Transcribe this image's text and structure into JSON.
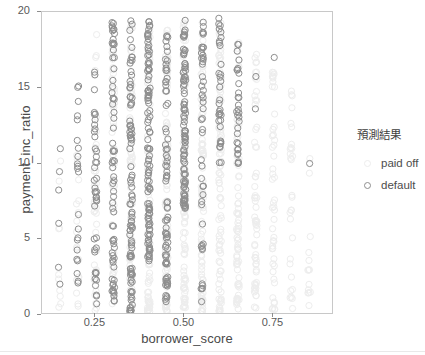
{
  "chart_data": {
    "type": "scatter",
    "title": "",
    "xlabel": "borrower_score",
    "ylabel": "payment_inc_ratio",
    "xlim": [
      0.1,
      0.92
    ],
    "ylim": [
      0,
      20
    ],
    "xticks": [
      0.25,
      0.5,
      0.75
    ],
    "xtick_labels": [
      "0.25",
      "0.50",
      "0.75"
    ],
    "yticks": [
      0,
      5,
      10,
      15,
      20
    ],
    "ytick_labels": [
      "0",
      "5",
      "10",
      "15",
      "20"
    ],
    "grid": false,
    "legend": {
      "title": "預測結果",
      "position": "right",
      "entries": [
        {
          "label": "paid off",
          "color": "#ededed",
          "marker": "open-circle"
        },
        {
          "label": "default",
          "color": "#8e8e8e",
          "marker": "open-circle"
        }
      ]
    },
    "marker": {
      "shape": "open-circle",
      "radius": 3.1,
      "stroke_width": 1
    },
    "x_columns": [
      0.15,
      0.2,
      0.25,
      0.3,
      0.35,
      0.4,
      0.45,
      0.5,
      0.55,
      0.6,
      0.65,
      0.7,
      0.75,
      0.8,
      0.85
    ],
    "series": [
      {
        "name": "default",
        "color": "#8e8e8e",
        "columns": [
          {
            "x": 0.15,
            "count": 6,
            "ymin": 1.8,
            "ymax": 11.3
          },
          {
            "x": 0.2,
            "count": 22,
            "ymin": 1.8,
            "ymax": 17.0
          },
          {
            "x": 0.25,
            "count": 42,
            "ymin": 0.4,
            "ymax": 16.3
          },
          {
            "x": 0.3,
            "count": 68,
            "ymin": 0.9,
            "ymax": 19.4
          },
          {
            "x": 0.35,
            "count": 96,
            "ymin": 0.2,
            "ymax": 19.6
          },
          {
            "x": 0.4,
            "count": 104,
            "ymin": 3.4,
            "ymax": 19.4
          },
          {
            "x": 0.45,
            "count": 78,
            "ymin": 0.7,
            "ymax": 18.6
          },
          {
            "x": 0.5,
            "count": 92,
            "ymin": 7.0,
            "ymax": 19.6
          },
          {
            "x": 0.55,
            "count": 48,
            "ymin": 0.8,
            "ymax": 19.4
          },
          {
            "x": 0.6,
            "count": 34,
            "ymin": 10.0,
            "ymax": 19.6
          },
          {
            "x": 0.65,
            "count": 30,
            "ymin": 10.0,
            "ymax": 18.2
          },
          {
            "x": 0.7,
            "count": 2,
            "ymin": 9.2,
            "ymax": 17.6
          },
          {
            "x": 0.75,
            "count": 1,
            "ymin": 17.0,
            "ymax": 17.0
          },
          {
            "x": 0.85,
            "count": 1,
            "ymin": 10.0,
            "ymax": 10.0
          }
        ]
      },
      {
        "name": "paid off",
        "color": "#ededed",
        "columns": [
          {
            "x": 0.15,
            "count": 10,
            "ymin": 0.5,
            "ymax": 13.0
          },
          {
            "x": 0.2,
            "count": 18,
            "ymin": 0.4,
            "ymax": 14.0
          },
          {
            "x": 0.25,
            "count": 40,
            "ymin": 0.3,
            "ymax": 19.0
          },
          {
            "x": 0.3,
            "count": 56,
            "ymin": 0.3,
            "ymax": 18.5
          },
          {
            "x": 0.35,
            "count": 70,
            "ymin": 0.2,
            "ymax": 19.2
          },
          {
            "x": 0.4,
            "count": 86,
            "ymin": 0.2,
            "ymax": 19.3
          },
          {
            "x": 0.45,
            "count": 92,
            "ymin": 0.2,
            "ymax": 18.8
          },
          {
            "x": 0.5,
            "count": 96,
            "ymin": 0.2,
            "ymax": 19.5
          },
          {
            "x": 0.55,
            "count": 90,
            "ymin": 0.2,
            "ymax": 19.4
          },
          {
            "x": 0.6,
            "count": 84,
            "ymin": 0.2,
            "ymax": 19.6
          },
          {
            "x": 0.65,
            "count": 76,
            "ymin": 0.2,
            "ymax": 18.2
          },
          {
            "x": 0.7,
            "count": 62,
            "ymin": 0.2,
            "ymax": 17.6
          },
          {
            "x": 0.75,
            "count": 48,
            "ymin": 0.3,
            "ymax": 17.0
          },
          {
            "x": 0.8,
            "count": 30,
            "ymin": 0.4,
            "ymax": 15.5
          },
          {
            "x": 0.85,
            "count": 14,
            "ymin": 0.6,
            "ymax": 12.5
          }
        ]
      }
    ]
  },
  "axes": {
    "x_title": "borrower_score",
    "y_title": "payment_inc_ratio"
  }
}
